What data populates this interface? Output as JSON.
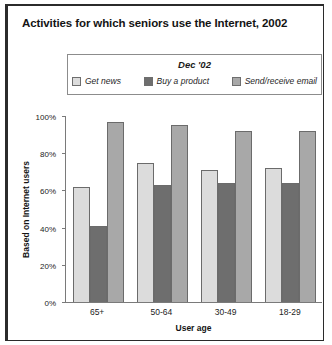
{
  "chart_data": {
    "type": "bar",
    "title": "Activities for which seniors use the Internet, 2002",
    "legend_title": "Dec '02",
    "legend_position": "top-center",
    "grid": false,
    "xlabel": "User age",
    "ylabel": "Based on Internet users",
    "categories": [
      "65+",
      "50-64",
      "30-49",
      "18-29"
    ],
    "ylim": [
      0,
      100
    ],
    "yticks": [
      "0%",
      "20%",
      "40%",
      "60%",
      "80%",
      "100%"
    ],
    "ytick_values": [
      0,
      20,
      40,
      60,
      80,
      100
    ],
    "series": [
      {
        "name": "Get news",
        "color": "#dcdcdc",
        "values": [
          62,
          75,
          71,
          72
        ]
      },
      {
        "name": "Buy a product",
        "color": "#6e6e6e",
        "values": [
          41,
          63,
          64,
          64
        ]
      },
      {
        "name": "Send/receive email",
        "color": "#a8a8a8",
        "values": [
          97,
          95,
          92,
          92
        ]
      }
    ]
  }
}
